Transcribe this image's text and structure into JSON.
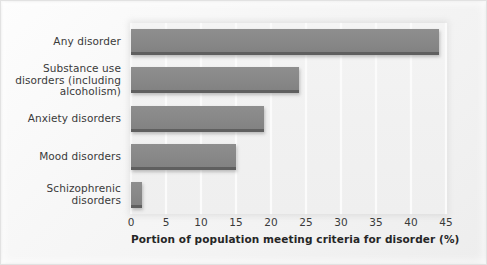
{
  "chart_data": {
    "type": "bar",
    "orientation": "horizontal",
    "title": "",
    "subtitle": "",
    "xlabel": "Portion of population meeting criteria for disorder (%)",
    "ylabel": "",
    "categories": [
      "Any disorder",
      "Substance use disorders (including alcoholism)",
      "Anxiety disorders",
      "Mood disorders",
      "Schizophrenic disorders"
    ],
    "category_lines": [
      [
        "Any disorder"
      ],
      [
        "Substance use",
        "disorders (including",
        "alcoholism)"
      ],
      [
        "Anxiety disorders"
      ],
      [
        "Mood disorders"
      ],
      [
        "Schizophrenic",
        "disorders"
      ]
    ],
    "values": [
      44,
      24,
      19,
      15,
      1.5
    ],
    "xlim": [
      0,
      45
    ],
    "xticks": [
      0,
      5,
      10,
      15,
      20,
      25,
      30,
      35,
      40,
      45
    ],
    "xtick_labels": [
      "0",
      "5",
      "10",
      "15",
      "20",
      "25",
      "30",
      "35",
      "40",
      "45"
    ],
    "grid": true,
    "grid_axis": "x",
    "legend": false,
    "legend_position": "none",
    "bar_color": "#888888",
    "bar_edge_color": "#5f5f5f",
    "plot_background": "#f1f1f1",
    "gridline_color": "#fbfbfb",
    "text_color": "#3a3a3a"
  }
}
